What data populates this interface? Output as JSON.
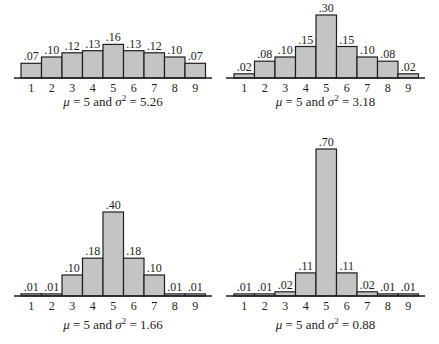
{
  "chart_data": [
    {
      "type": "bar",
      "title": "",
      "caption": {
        "mu_symbol": "μ",
        "mu": "5",
        "and": "and",
        "sigma_symbol": "σ",
        "exp": "2",
        "variance": "5.26"
      },
      "categories": [
        "1",
        "2",
        "3",
        "4",
        "5",
        "6",
        "7",
        "8",
        "9"
      ],
      "values": [
        0.07,
        0.1,
        0.12,
        0.13,
        0.16,
        0.13,
        0.12,
        0.1,
        0.07
      ],
      "value_labels": [
        ".07",
        ".10",
        ".12",
        ".13",
        ".16",
        ".13",
        ".12",
        ".10",
        ".07"
      ],
      "xlabel": "",
      "ylabel": "",
      "grid": false
    },
    {
      "type": "bar",
      "title": "",
      "caption": {
        "mu_symbol": "μ",
        "mu": "5",
        "and": "and",
        "sigma_symbol": "σ",
        "exp": "2",
        "variance": "3.18"
      },
      "categories": [
        "1",
        "2",
        "3",
        "4",
        "5",
        "6",
        "7",
        "8",
        "9"
      ],
      "values": [
        0.02,
        0.08,
        0.1,
        0.15,
        0.3,
        0.15,
        0.1,
        0.08,
        0.02
      ],
      "value_labels": [
        ".02",
        ".08",
        ".10",
        ".15",
        ".30",
        ".15",
        ".10",
        ".08",
        ".02"
      ],
      "xlabel": "",
      "ylabel": "",
      "grid": false
    },
    {
      "type": "bar",
      "title": "",
      "caption": {
        "mu_symbol": "μ",
        "mu": "5",
        "and": "and",
        "sigma_symbol": "σ",
        "exp": "2",
        "variance": "1.66"
      },
      "categories": [
        "1",
        "2",
        "3",
        "4",
        "5",
        "6",
        "7",
        "8",
        "9"
      ],
      "values": [
        0.01,
        0.01,
        0.1,
        0.18,
        0.4,
        0.18,
        0.1,
        0.01,
        0.01
      ],
      "value_labels": [
        ".01",
        ".01",
        ".10",
        ".18",
        ".40",
        ".18",
        ".10",
        ".01",
        ".01"
      ],
      "xlabel": "",
      "ylabel": "",
      "grid": false
    },
    {
      "type": "bar",
      "title": "",
      "caption": {
        "mu_symbol": "μ",
        "mu": "5",
        "and": "and",
        "sigma_symbol": "σ",
        "exp": "2",
        "variance": "0.88"
      },
      "categories": [
        "1",
        "2",
        "3",
        "4",
        "5",
        "6",
        "7",
        "8",
        "9"
      ],
      "values": [
        0.01,
        0.01,
        0.02,
        0.11,
        0.7,
        0.11,
        0.02,
        0.01,
        0.01
      ],
      "value_labels": [
        ".01",
        ".01",
        ".02",
        ".11",
        ".70",
        ".11",
        ".02",
        ".01",
        ".01"
      ],
      "xlabel": "",
      "ylabel": "",
      "grid": false
    }
  ]
}
